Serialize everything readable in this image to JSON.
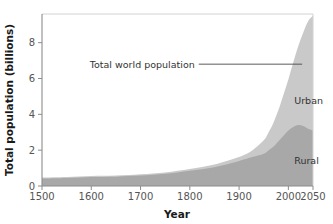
{
  "chart_data": {
    "type": "area",
    "stacked": true,
    "title": "",
    "xlabel": "Year",
    "ylabel": "Total population (billions)",
    "xlim": [
      1500,
      2050
    ],
    "ylim": [
      0,
      9.6
    ],
    "xticks": [
      1500,
      1600,
      1700,
      1800,
      1900,
      2000,
      2050
    ],
    "xtick_labels": [
      "1500",
      "1600",
      "1700",
      "1800",
      "1900",
      "2000",
      "2050"
    ],
    "yticks": [
      0,
      2,
      4,
      6,
      8
    ],
    "ytick_labels": [
      "0",
      "2",
      "4",
      "6",
      "8"
    ],
    "grid": false,
    "legend_position": "inline-labels",
    "x": [
      1500,
      1550,
      1600,
      1650,
      1700,
      1750,
      1800,
      1850,
      1900,
      1925,
      1950,
      1960,
      1970,
      1980,
      1990,
      2000,
      2010,
      2020,
      2030,
      2040,
      2050
    ],
    "series": [
      {
        "name": "Rural",
        "color": "#a8a8a8",
        "values": [
          0.42,
          0.45,
          0.5,
          0.52,
          0.58,
          0.68,
          0.85,
          1.05,
          1.4,
          1.6,
          1.8,
          2.0,
          2.2,
          2.5,
          2.8,
          3.1,
          3.3,
          3.4,
          3.35,
          3.2,
          3.1
        ]
      },
      {
        "name": "Urban",
        "color": "#c9c9c9",
        "values": [
          0.05,
          0.05,
          0.06,
          0.06,
          0.07,
          0.08,
          0.1,
          0.15,
          0.22,
          0.35,
          0.75,
          1.0,
          1.35,
          1.75,
          2.3,
          2.85,
          3.6,
          4.4,
          5.2,
          6.0,
          6.4
        ]
      }
    ],
    "totals": [
      0.47,
      0.5,
      0.56,
      0.58,
      0.65,
      0.76,
      0.95,
      1.2,
      1.62,
      1.95,
      2.55,
      3.0,
      3.55,
      4.25,
      5.1,
      5.95,
      6.9,
      7.8,
      8.55,
      9.2,
      9.5
    ],
    "annotations": [
      {
        "name": "total-world-population",
        "text": "Total world population",
        "x": 1810,
        "y": 6.8,
        "leader_to_x": 2028,
        "leader_to_y": 6.8
      }
    ],
    "series_labels": [
      {
        "name": "urban-label",
        "text": "Urban",
        "x": 2012,
        "y": 4.6
      },
      {
        "name": "rural-label",
        "text": "Rural",
        "x": 2012,
        "y": 1.25
      }
    ],
    "colors": {
      "urban": "#c9c9c9",
      "rural": "#a8a8a8",
      "axis": "#8c8c8c",
      "text": "#333333",
      "background": "#ffffff"
    }
  }
}
